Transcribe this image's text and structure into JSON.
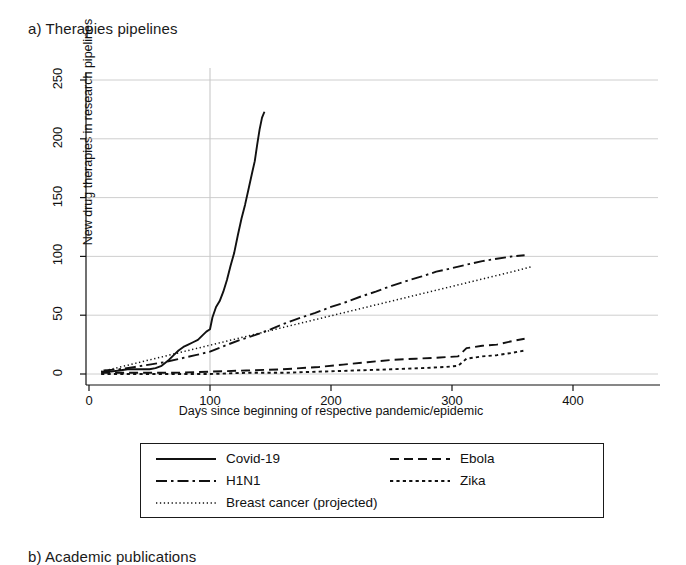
{
  "figure": {
    "panel_label": "a) Therapies pipelines",
    "next_panel_label": "b) Academic publications"
  },
  "chart_data": {
    "type": "line",
    "title": "a) Therapies pipelines",
    "xlabel": "Days since beginning of respective pandemic/epidemic",
    "ylabel": "New drug therapies in research pipelines",
    "xlim": [
      -8,
      420
    ],
    "ylim": [
      -12,
      262
    ],
    "xticks": [
      0,
      100,
      200,
      300,
      400
    ],
    "yticks": [
      0,
      50,
      100,
      150,
      200,
      250
    ],
    "xtick_labels": [
      "0",
      "100",
      "200",
      "300",
      "400"
    ],
    "ytick_labels": [
      "0",
      "50",
      "100",
      "150",
      "200",
      "250"
    ],
    "grid": "horizontal gridlines at each y tick plus one vertical gridline at x=100",
    "vertical_reference_line_x": 100,
    "legend_position": "below plot, bordered box, two columns",
    "series": [
      {
        "name": "Covid-19",
        "style": "solid",
        "points": [
          [
            10,
            2
          ],
          [
            18,
            2
          ],
          [
            25,
            3
          ],
          [
            32,
            4
          ],
          [
            38,
            4
          ],
          [
            44,
            4
          ],
          [
            50,
            4
          ],
          [
            55,
            5
          ],
          [
            60,
            7
          ],
          [
            66,
            12
          ],
          [
            70,
            16
          ],
          [
            74,
            20
          ],
          [
            78,
            23
          ],
          [
            82,
            25
          ],
          [
            86,
            27
          ],
          [
            90,
            29
          ],
          [
            94,
            33
          ],
          [
            97,
            36
          ],
          [
            100,
            38
          ],
          [
            102,
            48
          ],
          [
            105,
            57
          ],
          [
            108,
            62
          ],
          [
            111,
            70
          ],
          [
            114,
            80
          ],
          [
            117,
            92
          ],
          [
            120,
            103
          ],
          [
            123,
            118
          ],
          [
            126,
            132
          ],
          [
            129,
            144
          ],
          [
            132,
            158
          ],
          [
            135,
            172
          ],
          [
            137,
            181
          ],
          [
            139,
            195
          ],
          [
            141,
            208
          ],
          [
            143,
            218
          ],
          [
            145,
            223
          ]
        ]
      },
      {
        "name": "H1N1",
        "style": "dash-dot",
        "points": [
          [
            12,
            3
          ],
          [
            25,
            4
          ],
          [
            38,
            6
          ],
          [
            50,
            8
          ],
          [
            62,
            10
          ],
          [
            75,
            13
          ],
          [
            88,
            16
          ],
          [
            100,
            19
          ],
          [
            112,
            24
          ],
          [
            125,
            29
          ],
          [
            137,
            33
          ],
          [
            150,
            38
          ],
          [
            162,
            43
          ],
          [
            175,
            48
          ],
          [
            187,
            52
          ],
          [
            200,
            57
          ],
          [
            212,
            61
          ],
          [
            225,
            66
          ],
          [
            237,
            70
          ],
          [
            250,
            75
          ],
          [
            262,
            79
          ],
          [
            275,
            83
          ],
          [
            287,
            87
          ],
          [
            300,
            90
          ],
          [
            312,
            93
          ],
          [
            325,
            96
          ],
          [
            337,
            98
          ],
          [
            350,
            100
          ],
          [
            360,
            101
          ]
        ]
      },
      {
        "name": "Breast cancer (projected)",
        "style": "dotted-fine",
        "points": [
          [
            10,
            2
          ],
          [
            30,
            7
          ],
          [
            50,
            12
          ],
          [
            70,
            17
          ],
          [
            90,
            22
          ],
          [
            110,
            27
          ],
          [
            130,
            32
          ],
          [
            150,
            37
          ],
          [
            170,
            42
          ],
          [
            190,
            47
          ],
          [
            210,
            52
          ],
          [
            230,
            57
          ],
          [
            250,
            62
          ],
          [
            270,
            67
          ],
          [
            290,
            72
          ],
          [
            310,
            77
          ],
          [
            330,
            82
          ],
          [
            350,
            87
          ],
          [
            365,
            91
          ]
        ]
      },
      {
        "name": "Ebola",
        "style": "dashed",
        "points": [
          [
            10,
            1
          ],
          [
            40,
            1
          ],
          [
            70,
            1
          ],
          [
            100,
            2
          ],
          [
            130,
            3
          ],
          [
            160,
            4
          ],
          [
            190,
            6
          ],
          [
            210,
            8
          ],
          [
            230,
            10
          ],
          [
            250,
            12
          ],
          [
            270,
            13
          ],
          [
            290,
            14
          ],
          [
            305,
            15
          ],
          [
            312,
            22
          ],
          [
            325,
            24
          ],
          [
            337,
            25
          ],
          [
            350,
            28
          ],
          [
            360,
            30
          ]
        ]
      },
      {
        "name": "Zika",
        "style": "dotted",
        "points": [
          [
            10,
            0
          ],
          [
            40,
            0
          ],
          [
            70,
            0
          ],
          [
            100,
            0
          ],
          [
            130,
            1
          ],
          [
            160,
            1
          ],
          [
            190,
            2
          ],
          [
            220,
            3
          ],
          [
            250,
            4
          ],
          [
            275,
            5
          ],
          [
            295,
            6
          ],
          [
            305,
            7
          ],
          [
            312,
            13
          ],
          [
            325,
            15
          ],
          [
            337,
            16
          ],
          [
            350,
            18
          ],
          [
            360,
            20
          ]
        ]
      }
    ]
  },
  "legend": {
    "entries": [
      {
        "label": "Covid-19",
        "style": "solid",
        "column": "left"
      },
      {
        "label": "H1N1",
        "style": "dash-dot",
        "column": "left"
      },
      {
        "label": "Breast cancer (projected)",
        "style": "dotted-fine",
        "column": "left"
      },
      {
        "label": "Ebola",
        "style": "dashed",
        "column": "right"
      },
      {
        "label": "Zika",
        "style": "dotted",
        "column": "right"
      }
    ]
  },
  "colors": {
    "ink": "#111111",
    "grid": "#c8c8c8",
    "background": "#ffffff"
  }
}
